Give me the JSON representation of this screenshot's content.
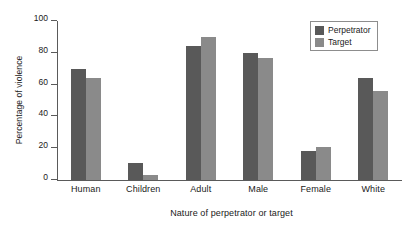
{
  "chart_data": {
    "type": "bar",
    "title": "",
    "xlabel": "Nature of perpetrator or target",
    "ylabel": "Percentage of violence",
    "categories": [
      "Human",
      "Children",
      "Adult",
      "Male",
      "Female",
      "White"
    ],
    "series": [
      {
        "name": "Perpetrator",
        "color": "#595959",
        "values": [
          70,
          11,
          84,
          80,
          18,
          64
        ]
      },
      {
        "name": "Target",
        "color": "#8a8a8a",
        "values": [
          64,
          3,
          90,
          77,
          21,
          56
        ]
      }
    ],
    "ylim": [
      0,
      100
    ],
    "yticks": [
      0,
      20,
      40,
      60,
      80,
      100
    ],
    "ytick_labels": [
      "0",
      "20",
      "40",
      "60",
      "80",
      "100"
    ],
    "grid": false,
    "legend_position": "top-right",
    "legend_entries": [
      "Perpetrator",
      "Target"
    ]
  }
}
